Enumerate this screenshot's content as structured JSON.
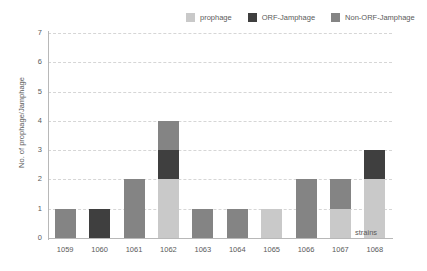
{
  "chart_data": {
    "type": "bar",
    "stacked": true,
    "title": "",
    "xlabel": "strains",
    "ylabel": "No. of prophage/Jamphage",
    "ylim": [
      0,
      7
    ],
    "yticks": [
      0,
      1,
      2,
      3,
      4,
      5,
      6,
      7
    ],
    "grid": true,
    "legend_position": "top-right",
    "categories": [
      "1059",
      "1060",
      "1061",
      "1062",
      "1063",
      "1064",
      "1065",
      "1066",
      "1067",
      "1068"
    ],
    "series": [
      {
        "name": "prophage",
        "color": "#c9c9c9",
        "values": [
          0,
          0,
          0,
          2,
          0,
          0,
          1,
          0,
          1,
          2
        ]
      },
      {
        "name": "ORF-Jamphage",
        "color": "#3f3f3f",
        "values": [
          0,
          1,
          0,
          1,
          0,
          0,
          0,
          0,
          0,
          1
        ]
      },
      {
        "name": "Non-ORF-Jamphage",
        "color": "#848484",
        "values": [
          1,
          0,
          2,
          1,
          1,
          1,
          0,
          2,
          1,
          0
        ]
      }
    ],
    "totals": [
      1,
      1,
      2,
      4,
      1,
      1,
      1,
      2,
      2,
      3
    ]
  },
  "colors": {
    "background": "#ffffff",
    "axis_line": "#b8b8b8",
    "gridline": "#d6d6d6",
    "text": "#5a5a5a"
  }
}
